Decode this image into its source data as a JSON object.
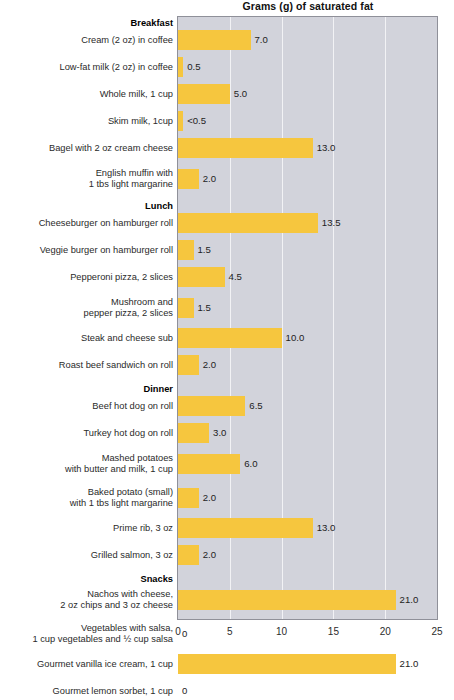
{
  "chart_data": {
    "type": "bar",
    "orientation": "horizontal",
    "title": "Grams (g) of saturated fat",
    "xlabel": "",
    "ylabel": "",
    "xlim": [
      0,
      25
    ],
    "xticks": [
      0,
      5,
      10,
      15,
      20,
      25
    ],
    "xtick_labels": [
      "0",
      "5",
      "10",
      "15",
      "20",
      "25"
    ],
    "grid": "vertical",
    "legend": "none",
    "bar_color": "#f6c63e",
    "plot_background": "#d2d3db",
    "gridline_color": "#f2f2f5",
    "sections": [
      "Breakfast",
      "Lunch",
      "Dinner",
      "Snacks"
    ],
    "categories": [
      "Cream (2 oz) in coffee",
      "Low-fat milk (2 oz) in coffee",
      "Whole milk, 1 cup",
      "Skim milk, 1cup",
      "Bagel with 2 oz cream cheese",
      "English muffin with 1 tbs light margarine",
      "Cheeseburger on hamburger roll",
      "Veggie burger on hamburger roll",
      "Pepperoni pizza, 2 slices",
      "Mushroom and pepper pizza, 2 slices",
      "Steak and cheese sub",
      "Roast beef sandwich on roll",
      "Beef hot dog on roll",
      "Turkey hot dog on roll",
      "Mashed potatoes with butter and milk, 1 cup",
      "Baked potato (small) with 1 tbs light margarine",
      "Prime rib, 3 oz",
      "Grilled salmon, 3 oz",
      "Nachos with cheese, 2 oz chips and 3 oz cheese",
      "Vegetables with salsa, 1 cup vegetables and ½ cup salsa",
      "Gourmet vanilla ice cream, 1 cup",
      "Gourmet lemon sorbet, 1 cup"
    ],
    "values": [
      7.0,
      0.5,
      5.0,
      0.5,
      13.0,
      2.0,
      13.5,
      1.5,
      4.5,
      1.5,
      10.0,
      2.0,
      6.5,
      3.0,
      6.0,
      2.0,
      13.0,
      2.0,
      21.0,
      0,
      21.0,
      0
    ],
    "value_labels": [
      "7.0",
      "0.5",
      "5.0",
      "<0.5",
      "13.0",
      "2.0",
      "13.5",
      "1.5",
      "4.5",
      "1.5",
      "10.0",
      "2.0",
      "6.5",
      "3.0",
      "6.0",
      "2.0",
      "13.0",
      "2.0",
      "21.0",
      "0",
      "21.0",
      "0"
    ]
  },
  "rows": [
    {
      "kind": "section",
      "label": "Breakfast"
    },
    {
      "kind": "bar",
      "label": "Cream (2 oz) in coffee",
      "value": 7.0,
      "value_label": "7.0"
    },
    {
      "kind": "bar",
      "label": "Low-fat milk (2 oz) in coffee",
      "value": 0.5,
      "value_label": "0.5"
    },
    {
      "kind": "bar",
      "label": "Whole milk, 1 cup",
      "value": 5.0,
      "value_label": "5.0"
    },
    {
      "kind": "bar",
      "label": "Skim milk, 1cup",
      "value": 0.5,
      "value_label": "<0.5"
    },
    {
      "kind": "bar",
      "label": "Bagel with 2 oz cream cheese",
      "value": 13.0,
      "value_label": "13.0"
    },
    {
      "kind": "bar",
      "label": "English muffin with\n1 tbs light margarine",
      "value": 2.0,
      "value_label": "2.0"
    },
    {
      "kind": "section",
      "label": "Lunch"
    },
    {
      "kind": "bar",
      "label": "Cheeseburger on hamburger roll",
      "value": 13.5,
      "value_label": "13.5"
    },
    {
      "kind": "bar",
      "label": "Veggie burger on hamburger roll",
      "value": 1.5,
      "value_label": "1.5"
    },
    {
      "kind": "bar",
      "label": "Pepperoni pizza, 2 slices",
      "value": 4.5,
      "value_label": "4.5"
    },
    {
      "kind": "bar",
      "label": "Mushroom and\npepper pizza, 2 slices",
      "value": 1.5,
      "value_label": "1.5"
    },
    {
      "kind": "bar",
      "label": "Steak and cheese sub",
      "value": 10.0,
      "value_label": "10.0"
    },
    {
      "kind": "bar",
      "label": "Roast beef sandwich on roll",
      "value": 2.0,
      "value_label": "2.0"
    },
    {
      "kind": "section",
      "label": "Dinner"
    },
    {
      "kind": "bar",
      "label": "Beef hot dog on roll",
      "value": 6.5,
      "value_label": "6.5"
    },
    {
      "kind": "bar",
      "label": "Turkey hot dog on roll",
      "value": 3.0,
      "value_label": "3.0"
    },
    {
      "kind": "bar",
      "label": "Mashed potatoes\nwith butter and milk, 1 cup",
      "value": 6.0,
      "value_label": "6.0"
    },
    {
      "kind": "bar",
      "label": "Baked potato (small)\nwith 1 tbs light margarine",
      "value": 2.0,
      "value_label": "2.0"
    },
    {
      "kind": "bar",
      "label": "Prime rib, 3 oz",
      "value": 13.0,
      "value_label": "13.0"
    },
    {
      "kind": "bar",
      "label": "Grilled salmon, 3 oz",
      "value": 2.0,
      "value_label": "2.0"
    },
    {
      "kind": "section",
      "label": "Snacks"
    },
    {
      "kind": "bar",
      "label": "Nachos with cheese,\n2 oz chips and 3 oz cheese",
      "value": 21.0,
      "value_label": "21.0"
    },
    {
      "kind": "bar",
      "label": "Vegetables with salsa,\n1 cup vegetables and ½ cup salsa",
      "value": 0,
      "value_label": "0"
    },
    {
      "kind": "bar",
      "label": "Gourmet vanilla ice cream, 1 cup",
      "value": 21.0,
      "value_label": "21.0"
    },
    {
      "kind": "bar",
      "label": "Gourmet lemon sorbet, 1 cup",
      "value": 0,
      "value_label": "0"
    }
  ]
}
